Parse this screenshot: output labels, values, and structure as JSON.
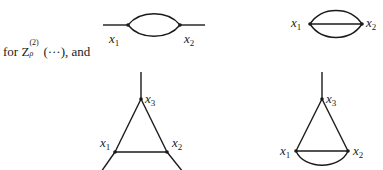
{
  "caption": {
    "prefix": "for ",
    "symbol": "Z",
    "superscript": "(2)",
    "subscript": "ρ",
    "args": "(···)",
    "suffix": ", and"
  },
  "diagrams": [
    {
      "id": "two-point-bubble",
      "labels": {
        "v1": "x",
        "v1_sub": "1",
        "v2": "x",
        "v2_sub": "2"
      }
    },
    {
      "id": "two-point-sunset",
      "labels": {
        "v1": "x",
        "v1_sub": "1",
        "v2": "x",
        "v2_sub": "2"
      }
    },
    {
      "id": "three-point-triangle",
      "labels": {
        "v1": "x",
        "v1_sub": "1",
        "v2": "x",
        "v2_sub": "2",
        "v3": "x",
        "v3_sub": "3"
      }
    },
    {
      "id": "three-point-triangle-with-bubble",
      "labels": {
        "v1": "x",
        "v1_sub": "1",
        "v2": "x",
        "v2_sub": "2",
        "v3": "x",
        "v3_sub": "3"
      }
    }
  ],
  "colors": {
    "ink": "#1a1a1a",
    "background": "#ffffff"
  }
}
